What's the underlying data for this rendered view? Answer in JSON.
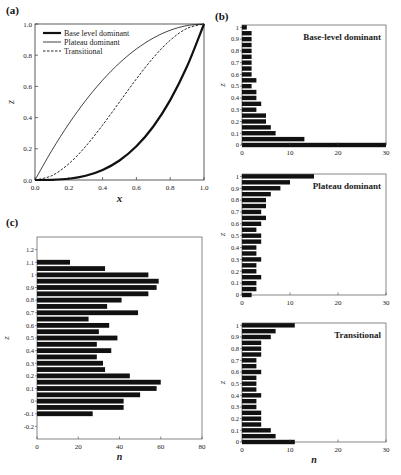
{
  "figure": {
    "panel_labels": {
      "a": "(a)",
      "b": "(b)",
      "c": "(c)"
    }
  },
  "chart_data": [
    {
      "id": "a",
      "type": "line",
      "title": "",
      "xlabel": "x",
      "ylabel": "z",
      "xlim": [
        0,
        1
      ],
      "ylim": [
        0,
        1
      ],
      "xticks": [
        "0.0",
        "0.2",
        "0.4",
        "0.6",
        "0.8",
        "1.0"
      ],
      "yticks": [
        "0.0",
        "0.2",
        "0.4",
        "0.6",
        "0.8",
        "1.0"
      ],
      "legend_position": "upper-left",
      "series": [
        {
          "name": "Base level dominant",
          "style": "thick-solid",
          "x": [
            0,
            0.1,
            0.2,
            0.3,
            0.4,
            0.5,
            0.6,
            0.7,
            0.8,
            0.9,
            1.0
          ],
          "y": [
            0,
            0.001,
            0.008,
            0.027,
            0.064,
            0.125,
            0.216,
            0.343,
            0.512,
            0.729,
            1.0
          ]
        },
        {
          "name": "Plateau dominant",
          "style": "thin-solid",
          "x": [
            0,
            0.1,
            0.2,
            0.3,
            0.4,
            0.5,
            0.6,
            0.7,
            0.8,
            0.9,
            1.0
          ],
          "y": [
            0,
            0.19,
            0.36,
            0.51,
            0.64,
            0.75,
            0.84,
            0.91,
            0.96,
            0.99,
            1.0
          ]
        },
        {
          "name": "Transitional",
          "style": "dashed",
          "x": [
            0,
            0.1,
            0.2,
            0.3,
            0.4,
            0.5,
            0.6,
            0.7,
            0.8,
            0.9,
            1.0
          ],
          "y": [
            0,
            0.028,
            0.104,
            0.216,
            0.352,
            0.5,
            0.648,
            0.784,
            0.896,
            0.972,
            1.0
          ]
        }
      ]
    },
    {
      "id": "b1",
      "type": "bar",
      "orientation": "horizontal",
      "title": "Base-level dominant",
      "xlabel": "n",
      "ylabel": "z",
      "xlim": [
        0,
        30
      ],
      "xticks": [
        "0",
        "10",
        "20",
        "30"
      ],
      "yticks": [
        "0",
        "0.1",
        "0.2",
        "0.3",
        "0.4",
        "0.5",
        "0.6",
        "0.7",
        "0.8",
        "0.9",
        "1"
      ],
      "categories": [
        0,
        0.05,
        0.1,
        0.15,
        0.2,
        0.25,
        0.3,
        0.35,
        0.4,
        0.45,
        0.5,
        0.55,
        0.6,
        0.65,
        0.7,
        0.75,
        0.8,
        0.85,
        0.9,
        0.95,
        1.0
      ],
      "values": [
        30,
        13,
        7,
        6,
        5,
        5,
        3,
        4,
        3,
        3,
        2,
        3,
        2,
        2,
        2,
        2,
        2,
        2,
        2,
        2,
        1
      ]
    },
    {
      "id": "b2",
      "type": "bar",
      "orientation": "horizontal",
      "title": "Plateau dominant",
      "xlabel": "n",
      "ylabel": "z",
      "xlim": [
        0,
        30
      ],
      "xticks": [
        "0",
        "10",
        "20",
        "30"
      ],
      "yticks": [
        "0",
        "0.1",
        "0.2",
        "0.3",
        "0.4",
        "0.5",
        "0.6",
        "0.7",
        "0.8",
        "0.9",
        "1"
      ],
      "categories": [
        0,
        0.05,
        0.1,
        0.15,
        0.2,
        0.25,
        0.3,
        0.35,
        0.4,
        0.45,
        0.5,
        0.55,
        0.6,
        0.65,
        0.7,
        0.75,
        0.8,
        0.85,
        0.9,
        0.95,
        1.0
      ],
      "values": [
        2,
        3,
        3,
        4,
        3,
        3,
        4,
        3,
        3,
        4,
        4,
        3,
        4,
        5,
        4,
        5,
        5,
        6,
        8,
        10,
        15
      ]
    },
    {
      "id": "b3",
      "type": "bar",
      "orientation": "horizontal",
      "title": "Transitional",
      "xlabel": "n",
      "ylabel": "z",
      "xlim": [
        0,
        30
      ],
      "xticks": [
        "0",
        "10",
        "20",
        "30"
      ],
      "yticks": [
        "0",
        "0.1",
        "0.2",
        "0.3",
        "0.4",
        "0.5",
        "0.6",
        "0.7",
        "0.8",
        "0.9",
        "1"
      ],
      "categories": [
        0,
        0.05,
        0.1,
        0.15,
        0.2,
        0.25,
        0.3,
        0.35,
        0.4,
        0.45,
        0.5,
        0.55,
        0.6,
        0.65,
        0.7,
        0.75,
        0.8,
        0.85,
        0.9,
        0.95,
        1.0
      ],
      "values": [
        11,
        7,
        6,
        4,
        4,
        4,
        3,
        3,
        4,
        3,
        3,
        3,
        4,
        3,
        3,
        4,
        4,
        4,
        6,
        7,
        11
      ]
    },
    {
      "id": "c",
      "type": "bar",
      "orientation": "horizontal",
      "title": "",
      "xlabel": "n",
      "ylabel": "z",
      "xlim": [
        0,
        80
      ],
      "ylim": [
        -0.3,
        1.3
      ],
      "xticks": [
        "0",
        "20",
        "40",
        "60",
        "80"
      ],
      "yticks": [
        "-0.2",
        "-0.1",
        "0",
        "0.1",
        "0.2",
        "0.3",
        "0.4",
        "0.5",
        "0.6",
        "0.7",
        "0.8",
        "0.9",
        "1",
        "1.1",
        "1.2"
      ],
      "categories": [
        -0.1,
        -0.05,
        0,
        0.05,
        0.1,
        0.15,
        0.2,
        0.25,
        0.3,
        0.35,
        0.4,
        0.45,
        0.5,
        0.55,
        0.6,
        0.65,
        0.7,
        0.75,
        0.8,
        0.85,
        0.9,
        0.95,
        1.0,
        1.05,
        1.1
      ],
      "values": [
        27,
        42,
        42,
        50,
        58,
        60,
        45,
        33,
        32,
        29,
        36,
        29,
        39,
        30,
        35,
        25,
        49,
        34,
        41,
        54,
        58,
        59,
        54,
        33,
        16
      ]
    }
  ]
}
